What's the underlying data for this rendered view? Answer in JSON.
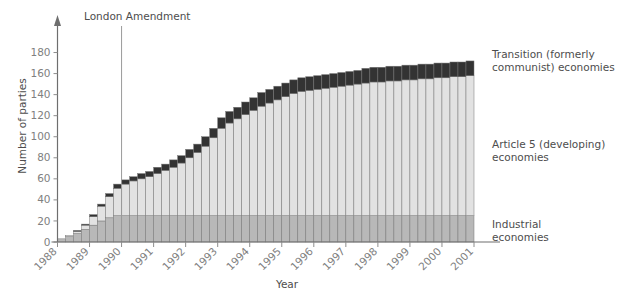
{
  "chart_data": {
    "type": "bar",
    "stacked": true,
    "title": "",
    "xlabel": "Year",
    "ylabel": "Number of parties",
    "ylim": [
      0,
      190
    ],
    "yticks": [
      0,
      20,
      40,
      60,
      80,
      100,
      120,
      140,
      160,
      180
    ],
    "xticks": [
      "1988",
      "1989",
      "1990",
      "1991",
      "1992",
      "1993",
      "1994",
      "1995",
      "1996",
      "1997",
      "1998",
      "1999",
      "2000",
      "2001"
    ],
    "grid": false,
    "legend_position": "right",
    "annotations": [
      {
        "label": "London Amendment",
        "x": "1990",
        "type": "vertical-line"
      }
    ],
    "categories": [
      "1988 Q1",
      "1988 Q2",
      "1988 Q3",
      "1988 Q4",
      "1989 Q1",
      "1989 Q2",
      "1989 Q3",
      "1989 Q4",
      "1990 Q1",
      "1990 Q2",
      "1990 Q3",
      "1990 Q4",
      "1991 Q1",
      "1991 Q2",
      "1991 Q3",
      "1991 Q4",
      "1992 Q1",
      "1992 Q2",
      "1992 Q3",
      "1992 Q4",
      "1993 Q1",
      "1993 Q2",
      "1993 Q3",
      "1993 Q4",
      "1994 Q1",
      "1994 Q2",
      "1994 Q3",
      "1994 Q4",
      "1995 Q1",
      "1995 Q2",
      "1995 Q3",
      "1995 Q4",
      "1996 Q1",
      "1996 Q2",
      "1996 Q3",
      "1996 Q4",
      "1997 Q1",
      "1997 Q2",
      "1997 Q3",
      "1997 Q4",
      "1998 Q1",
      "1998 Q2",
      "1998 Q3",
      "1998 Q4",
      "1999 Q1",
      "1999 Q2",
      "1999 Q3",
      "1999 Q4",
      "2000 Q1",
      "2000 Q2",
      "2000 Q3",
      "2000 Q4"
    ],
    "series": [
      {
        "name": "Industrial economies",
        "color": "#b8b8b8",
        "values": [
          3,
          5,
          8,
          12,
          16,
          20,
          23,
          25,
          25,
          25,
          25,
          25,
          25,
          25,
          25,
          25,
          25,
          25,
          25,
          25,
          25,
          25,
          25,
          25,
          25,
          25,
          25,
          25,
          25,
          25,
          25,
          25,
          25,
          25,
          25,
          25,
          25,
          25,
          25,
          25,
          25,
          25,
          25,
          25,
          25,
          25,
          25,
          25,
          25,
          25,
          25,
          25
        ]
      },
      {
        "name": "Article 5 (developing) economies",
        "color": "#e2e2e2",
        "values": [
          0,
          1,
          2,
          4,
          8,
          14,
          20,
          26,
          30,
          33,
          35,
          37,
          40,
          43,
          46,
          50,
          55,
          60,
          66,
          74,
          83,
          88,
          92,
          96,
          100,
          104,
          107,
          110,
          113,
          116,
          118,
          119,
          120,
          121,
          122,
          123,
          124,
          125,
          126,
          127,
          127,
          128,
          128,
          129,
          129,
          130,
          130,
          131,
          131,
          132,
          132,
          133
        ]
      },
      {
        "name": "Transition (formerly communist) economies",
        "color": "#333333",
        "values": [
          0,
          0,
          1,
          1,
          2,
          2,
          3,
          4,
          4,
          4,
          5,
          5,
          6,
          6,
          7,
          7,
          8,
          8,
          9,
          9,
          10,
          11,
          11,
          12,
          12,
          13,
          13,
          13,
          13,
          13,
          13,
          13,
          13,
          13,
          13,
          13,
          13,
          13,
          14,
          14,
          14,
          14,
          14,
          14,
          14,
          14,
          14,
          14,
          14,
          14,
          14,
          14
        ]
      }
    ],
    "totals": [
      3,
      6,
      11,
      17,
      26,
      36,
      46,
      55,
      59,
      62,
      65,
      67,
      71,
      74,
      78,
      82,
      88,
      93,
      100,
      108,
      118,
      124,
      128,
      133,
      137,
      142,
      145,
      148,
      151,
      154,
      156,
      157,
      158,
      159,
      160,
      161,
      162,
      163,
      164,
      165,
      166,
      167,
      167,
      168,
      168,
      169,
      169,
      170,
      170,
      171,
      171,
      172
    ]
  },
  "axis": {
    "ylabel": "Number of parties",
    "xlabel": "Year"
  },
  "annotation": {
    "london_amendment": "London Amendment"
  },
  "legend": {
    "transition": "Transition (formerly\ncommunist) economies",
    "article5": "Article 5 (developing)\neconomies",
    "industrial": "Industrial\neconomies"
  },
  "colors": {
    "industrial": "#b8b8b8",
    "article5": "#e2e2e2",
    "transition": "#333333",
    "axis": "#808080",
    "text": "#4d4d4d"
  }
}
